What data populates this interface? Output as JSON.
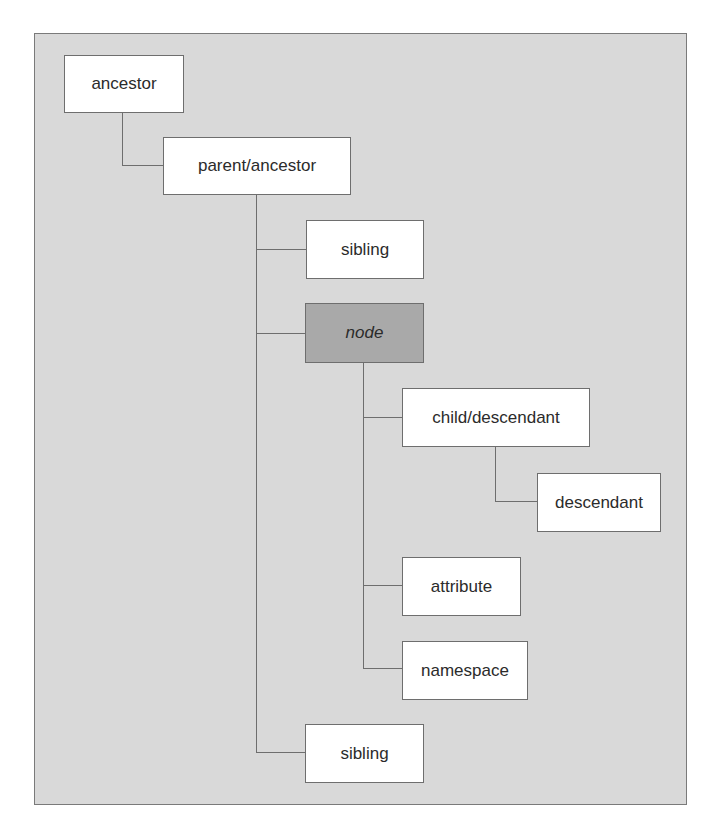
{
  "diagram": {
    "nodes": [
      {
        "id": "ancestor",
        "label": "ancestor"
      },
      {
        "id": "parent",
        "label": "parent/ancestor"
      },
      {
        "id": "sibling1",
        "label": "sibling"
      },
      {
        "id": "node",
        "label": "node",
        "highlighted": true
      },
      {
        "id": "child",
        "label": "child/descendant"
      },
      {
        "id": "descendant",
        "label": "descendant"
      },
      {
        "id": "attribute",
        "label": "attribute"
      },
      {
        "id": "namespace",
        "label": "namespace"
      },
      {
        "id": "sibling2",
        "label": "sibling"
      }
    ],
    "edges": [
      [
        "ancestor",
        "parent"
      ],
      [
        "parent",
        "sibling1"
      ],
      [
        "parent",
        "node"
      ],
      [
        "parent",
        "sibling2"
      ],
      [
        "node",
        "child"
      ],
      [
        "child",
        "descendant"
      ],
      [
        "node",
        "attribute"
      ],
      [
        "node",
        "namespace"
      ]
    ],
    "colors": {
      "background": "#d9d9d9",
      "box": "#ffffff",
      "highlight": "#a9a9a9",
      "line": "#6e6e6e"
    }
  }
}
